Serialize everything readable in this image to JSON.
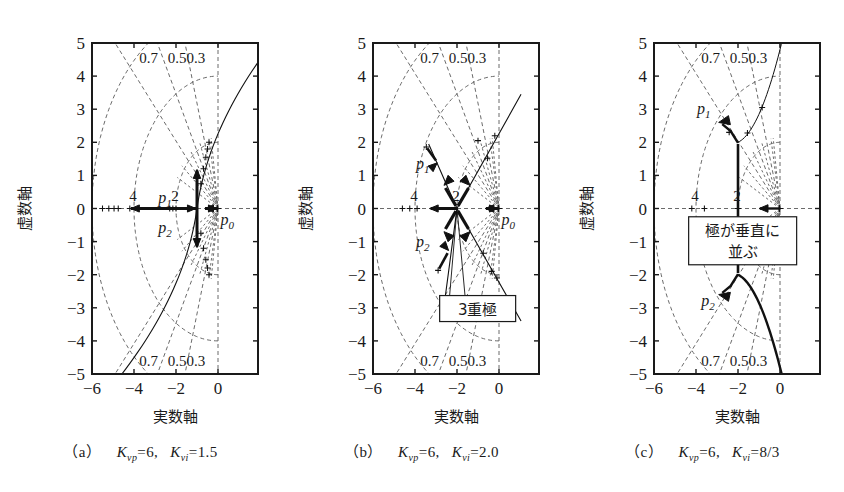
{
  "figure": {
    "axis_labels": {
      "imaginary": "虚数軸",
      "real": "実数軸"
    },
    "x_ticks": [
      "-6",
      "-4",
      "-2",
      "0"
    ],
    "y_ticks": [
      "5",
      "4",
      "3",
      "2",
      "1",
      "0",
      "-1",
      "-2",
      "-3",
      "-4",
      "-5"
    ],
    "damping_labels": [
      "0.7",
      "0.5",
      "0.3"
    ],
    "wn_labels": [
      "4",
      "2"
    ],
    "pole_labels": {
      "p0": "p",
      "p0sub": "0",
      "p1": "p",
      "p1sub": "1",
      "p2": "p",
      "p2sub": "2"
    },
    "colors": {
      "ink": "#1a1a1a",
      "grid": "#6b6b6b",
      "locus": "#111111"
    }
  },
  "panels": [
    {
      "id": "a",
      "caption_index": "（a）",
      "caption_kvp": "K",
      "caption_kvp_sub": "vp",
      "caption_kvp_val": "=6,",
      "caption_kvi": "K",
      "caption_kvi_sub": "vi",
      "caption_kvi_val": "=1.5",
      "annotation": null,
      "pole_labels_shown": [
        "p1",
        "p2",
        "p0"
      ],
      "wn_labels_shown": [
        "4",
        "2"
      ]
    },
    {
      "id": "b",
      "caption_index": "（b）",
      "caption_kvp": "K",
      "caption_kvp_sub": "vp",
      "caption_kvp_val": "=6,",
      "caption_kvi": "K",
      "caption_kvi_sub": "vi",
      "caption_kvi_val": "=2.0",
      "annotation": "3重極",
      "pole_labels_shown": [
        "p1",
        "p2",
        "p0"
      ],
      "wn_labels_shown": [
        "4",
        "2"
      ]
    },
    {
      "id": "c",
      "caption_index": "（c）",
      "caption_kvp": "K",
      "caption_kvp_sub": "vp",
      "caption_kvp_val": "=6,",
      "caption_kvi": "K",
      "caption_kvi_sub": "vi",
      "caption_kvi_val": "=8/3",
      "annotation_line1": "極が垂直に",
      "annotation_line2": "並ぶ",
      "pole_labels_shown": [
        "p1",
        "p2",
        "p0"
      ],
      "wn_labels_shown": [
        "4",
        "2"
      ]
    }
  ],
  "chart_data": {
    "type": "line",
    "xlabel": "実数軸",
    "ylabel": "虚数軸",
    "xlim": [
      -6.5,
      1.1
    ],
    "ylim": [
      -5,
      5
    ],
    "xticks": [
      -6,
      -4,
      -2,
      0
    ],
    "yticks": [
      -5,
      -4,
      -3,
      -2,
      -1,
      0,
      1,
      2,
      3,
      4,
      5
    ],
    "grid": false,
    "legend": "none",
    "overlays": {
      "constant_damping_rays": [
        0.3,
        0.5,
        0.7
      ],
      "constant_wn_arcs": [
        2,
        4,
        6
      ],
      "open_loop_pole_p0": [
        0,
        0
      ]
    },
    "series": [
      {
        "name": "(a) Kvp=6, Kvi=1.5 — real-axis branches",
        "panel": "a",
        "points": [
          [
            -6,
            0
          ],
          [
            -1,
            0
          ],
          [
            0,
            0
          ]
        ],
        "note": "breakaway near -1, arrows inward along real axis"
      },
      {
        "name": "(a) Kvp=6, Kvi=1.5 — complex branches",
        "panel": "a",
        "points": [
          [
            -1,
            0
          ],
          [
            -1,
            1.0
          ],
          [
            -0.9,
            2.0
          ],
          [
            -0.6,
            3.5
          ],
          [
            0.2,
            5.0
          ]
        ],
        "mirrored": true
      },
      {
        "name": "(b) Kvp=6, Kvi=2.0 — triple pole at -2",
        "panel": "b",
        "points": [
          [
            -6,
            0
          ],
          [
            -2,
            0
          ]
        ],
        "note": "three branches meet at s=-2 (3重極)"
      },
      {
        "name": "(b) branch toward upper-left",
        "panel": "b",
        "points": [
          [
            -2,
            0
          ],
          [
            -2.6,
            1.0
          ],
          [
            -3.2,
            1.85
          ]
        ]
      },
      {
        "name": "(b) branch toward lower-left",
        "panel": "b",
        "points": [
          [
            -2,
            0
          ],
          [
            -2.6,
            -1.0
          ],
          [
            -3.2,
            -1.85
          ]
        ]
      },
      {
        "name": "(b) branch toward upper-right asymptote",
        "panel": "b",
        "points": [
          [
            -2,
            0
          ],
          [
            -1.0,
            1.1
          ],
          [
            0.0,
            2.2
          ],
          [
            1.0,
            3.4
          ]
        ]
      },
      {
        "name": "(c) Kvp=6, Kvi=8/3 — vertical segment",
        "panel": "c",
        "points": [
          [
            -2,
            -2
          ],
          [
            -2,
            0
          ],
          [
            -2,
            2
          ]
        ],
        "note": "poles line up vertically (極が垂直に並ぶ)"
      },
      {
        "name": "(c) upper branch",
        "panel": "c",
        "points": [
          [
            -2,
            2
          ],
          [
            -2.4,
            2.3
          ],
          [
            -3.0,
            2.65
          ]
        ]
      },
      {
        "name": "(c) upper-right branch",
        "panel": "c",
        "points": [
          [
            -2,
            2
          ],
          [
            -1.4,
            2.3
          ],
          [
            -0.6,
            3.2
          ],
          [
            0.2,
            4.3
          ],
          [
            0.9,
            5.0
          ]
        ]
      },
      {
        "name": "(c) lower branch",
        "panel": "c",
        "points": [
          [
            -2,
            -2
          ],
          [
            -2.4,
            -2.3
          ],
          [
            -3.0,
            -2.65
          ]
        ]
      },
      {
        "name": "(c) lower-right branch",
        "panel": "c",
        "points": [
          [
            -2,
            -2
          ],
          [
            -1.4,
            -2.3
          ],
          [
            -0.6,
            -3.2
          ],
          [
            0.2,
            -4.3
          ],
          [
            0.7,
            -5.0
          ]
        ]
      },
      {
        "name": "(c) real-axis branch to p0",
        "panel": "c",
        "points": [
          [
            -1.0,
            0
          ],
          [
            0,
            0
          ]
        ]
      }
    ]
  }
}
